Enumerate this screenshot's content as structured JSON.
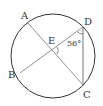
{
  "diagram": {
    "type": "circle-geometry",
    "circle": {
      "cx": 53,
      "cy": 56,
      "r": 42
    },
    "points": {
      "A": {
        "label": "A",
        "x": 27,
        "y": 22
      },
      "B": {
        "label": "B",
        "x": 20,
        "y": 73
      },
      "C": {
        "label": "C",
        "x": 83,
        "y": 85
      },
      "D": {
        "label": "D",
        "x": 83,
        "y": 27
      },
      "E": {
        "label": "E",
        "x": 52,
        "y": 50
      }
    },
    "segments": [
      "AC",
      "BD",
      "DC"
    ],
    "angle_label": "56°",
    "colors": {
      "stroke": "#333333",
      "chord": "#777777"
    }
  }
}
